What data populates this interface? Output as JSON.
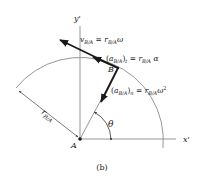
{
  "figure": {
    "caption": "(b)",
    "colors": {
      "line": "#8a8a8a",
      "vector": "#1a1a1a",
      "text": "#1a1a1a",
      "background": "#ffffff"
    }
  },
  "axes": {
    "x_label": "x'",
    "y_label": "y'"
  },
  "points": {
    "A": "A",
    "B": "B"
  },
  "labels": {
    "radius": "r",
    "radius_sub": "B/A",
    "angle": "θ",
    "velocity": {
      "lhs": "v",
      "lhs_sub": "B/A",
      "eq": " = ",
      "rhs": "r",
      "rhs_sub": "B/A",
      "rhs_tail": "ω"
    },
    "tangential_accel": {
      "lhs_open": "(a",
      "lhs_sub": "B/A",
      "lhs_close": ")",
      "lhs_close_sub": "t",
      "eq": " = ",
      "rhs": "r",
      "rhs_sub": "B/A",
      "rhs_tail": " α"
    },
    "normal_accel": {
      "lhs_open": "(a",
      "lhs_sub": "B/A",
      "lhs_close": ")",
      "lhs_close_sub": "n",
      "eq": " = ",
      "rhs": "r",
      "rhs_sub": "B/A",
      "rhs_tail": "ω",
      "rhs_sup": "2"
    }
  }
}
